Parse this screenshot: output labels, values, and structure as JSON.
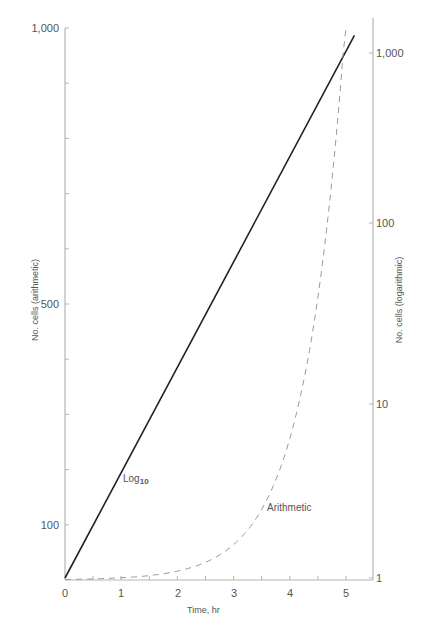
{
  "chart_data": {
    "type": "line",
    "title": "",
    "xlabel": "Time, hr",
    "ylabel_left": "No. cells (arithmetic)",
    "ylabel_right": "No. cells (logarithmic)",
    "x_ticks": [
      "0",
      "1",
      "2",
      "3",
      "4",
      "5"
    ],
    "x_minor_ticks": [
      0.5,
      1.5,
      2.5,
      3.5,
      4.5
    ],
    "xlim": [
      0,
      5.5
    ],
    "left_axis": {
      "scale": "linear",
      "ticks": [
        "1,000",
        "500",
        "100"
      ],
      "tick_values": [
        1000,
        500,
        100
      ],
      "minor_step": 100,
      "ylim": [
        0,
        1000
      ]
    },
    "right_axis": {
      "scale": "log",
      "ticks": [
        "1,000",
        "100",
        "10",
        "1"
      ],
      "tick_values": [
        1000,
        100,
        10,
        1
      ],
      "ylim": [
        1,
        1400
      ]
    },
    "grid": false,
    "series": [
      {
        "name": "Log10",
        "label": "Log",
        "label_sub": "10",
        "style": "solid",
        "color": "#222222",
        "axis": "right",
        "x": [
          0,
          0.5,
          1,
          1.5,
          2,
          2.5,
          3,
          3.5,
          4,
          4.5,
          5
        ],
        "values": [
          1,
          2,
          4,
          8,
          16,
          32,
          64,
          128,
          256,
          512,
          1024
        ]
      },
      {
        "name": "Arithmetic",
        "label": "Arithmetic",
        "style": "dashed",
        "color": "#999999",
        "axis": "left",
        "x": [
          0,
          0.5,
          1,
          1.5,
          2,
          2.5,
          3,
          3.5,
          4,
          4.5,
          5
        ],
        "values": [
          1,
          2,
          4,
          8,
          16,
          32,
          64,
          128,
          256,
          512,
          1024
        ]
      }
    ]
  }
}
